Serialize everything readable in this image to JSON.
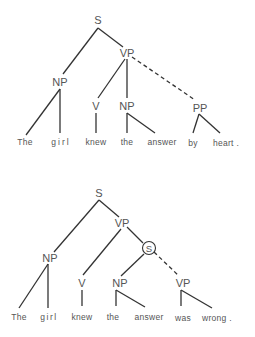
{
  "trees": [
    {
      "id": "tree-top",
      "nodes": {
        "S": "S",
        "VP": "VP",
        "NP_subj": "NP",
        "V": "V",
        "NP_obj": "NP",
        "PP": "PP"
      },
      "words": [
        "The",
        "girl",
        "knew",
        "the",
        "answer",
        "by",
        "heart ."
      ],
      "dashed_edge": "VP → PP"
    },
    {
      "id": "tree-bottom",
      "nodes": {
        "S": "S",
        "VP": "VP",
        "NP_subj": "NP",
        "V": "V",
        "S_embedded": "S",
        "NP_emb": "NP",
        "VP_emb": "VP"
      },
      "words": [
        "The",
        "girl",
        "knew",
        "the",
        "answer",
        "was",
        "wrong ."
      ],
      "dashed_edge": "S → VP",
      "circled_node": "S_embedded"
    }
  ]
}
